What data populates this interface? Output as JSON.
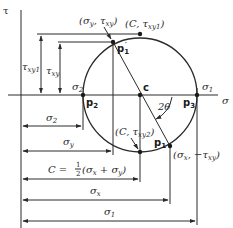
{
  "diagram": {
    "axes": {
      "vertical": {
        "label": "τ"
      },
      "horizontal": {
        "label": "σ"
      }
    },
    "center": {
      "label": "c"
    },
    "angle_label": "2θ",
    "points": {
      "p1_prime": {
        "label": "p",
        "sub": "1",
        "prime": "′",
        "coord_label": "(σ",
        "coord_sub1": "y",
        "coord_mid": ", τ",
        "coord_sub2": "xy",
        "coord_end": ")"
      },
      "top": {
        "coord_label": "(C, τ",
        "coord_sub": "xy1",
        "coord_end": ")"
      },
      "p2": {
        "label": "p",
        "sub": "2",
        "stress_label": "σ",
        "stress_sub": "2"
      },
      "p3": {
        "label": "p",
        "sub": "3",
        "stress_label": "σ",
        "stress_sub": "1"
      },
      "bottom": {
        "coord_label": "(C, τ",
        "coord_sub": "xy2",
        "coord_end": ")"
      },
      "p1": {
        "label": "p",
        "sub": "1",
        "coord_label": "(σ",
        "coord_sub1": "x",
        "coord_mid": ", −τ",
        "coord_sub2": "xy",
        "coord_end": ")"
      }
    },
    "vertical_dimensions": [
      {
        "label": "τ",
        "sub": "xy1"
      },
      {
        "label": "τ",
        "sub": "xy"
      }
    ],
    "horizontal_dimensions": [
      {
        "label": "σ",
        "sub": "2"
      },
      {
        "label": "σ",
        "sub": "y"
      },
      {
        "label": "C = ",
        "frac_num": "1",
        "frac_den": "2",
        "expr": "(σ",
        "sub_a": "x",
        "mid": " + σ",
        "sub_b": "y",
        "end": ")"
      },
      {
        "label": "σ",
        "sub": "x"
      },
      {
        "label": "σ",
        "sub": "1"
      }
    ]
  }
}
